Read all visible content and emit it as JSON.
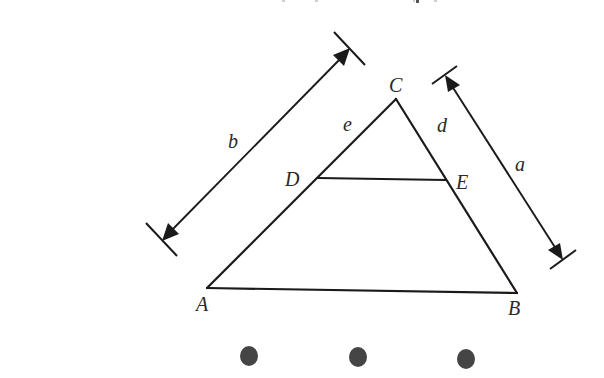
{
  "figure": {
    "type": "geometry-diagram",
    "vertices": {
      "A": {
        "label": "A",
        "x": 207,
        "y": 288
      },
      "B": {
        "label": "B",
        "x": 517,
        "y": 293
      },
      "C": {
        "label": "C",
        "x": 396,
        "y": 99
      },
      "D": {
        "label": "D",
        "x": 318,
        "y": 178
      },
      "E": {
        "label": "E",
        "x": 446,
        "y": 180
      }
    },
    "segment_labels": {
      "e": {
        "label": "e",
        "segment": "CD"
      },
      "d": {
        "label": "d",
        "segment": "CE"
      }
    },
    "dimensions": {
      "b": {
        "label": "b",
        "along": "AC"
      },
      "a": {
        "label": "a",
        "along": "BC"
      }
    }
  },
  "labels": {
    "A": "A",
    "B": "B",
    "C": "C",
    "D": "D",
    "E": "E",
    "a": "a",
    "b": "b",
    "d": "d",
    "e": "e"
  },
  "pager": {
    "dots": 3,
    "color": "#454545"
  },
  "colors": {
    "stroke": "#1a1a1a",
    "label": "#2a2a2a",
    "background": "#ffffff"
  }
}
